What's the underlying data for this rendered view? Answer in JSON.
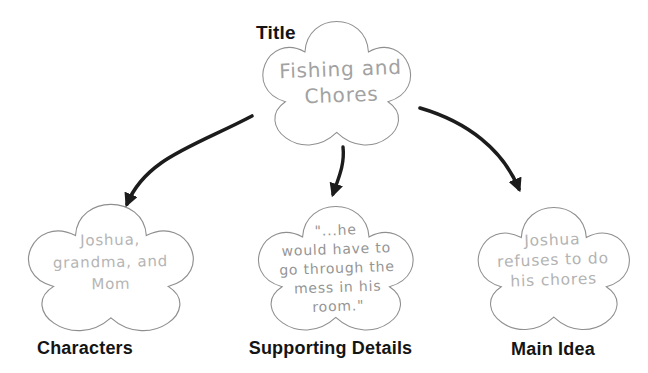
{
  "diagram_type": "story-map-star-web",
  "nodes": {
    "title": {
      "label": "Title",
      "lines": [
        "Fishing and",
        "Chores"
      ]
    },
    "characters": {
      "label": "Characters",
      "lines": [
        "Joshua,",
        "grandma, and",
        "Mom"
      ]
    },
    "supporting_details": {
      "label": "Supporting Details",
      "lines": [
        "\"...he",
        "would have to",
        "go through the",
        "mess in his",
        "room.\""
      ]
    },
    "main_idea": {
      "label": "Main Idea",
      "lines": [
        "Joshua",
        "refuses to do",
        "his chores"
      ]
    }
  },
  "edges": [
    {
      "from": "title",
      "to": "characters"
    },
    {
      "from": "title",
      "to": "supporting_details"
    },
    {
      "from": "title",
      "to": "main_idea"
    }
  ],
  "colors": {
    "cloud_outline": "#8f8f8f",
    "cloud_fill": "#ffffff",
    "arrow": "#1c1c1c",
    "label_text": "#141414",
    "pencil_title": "#a2a2a2",
    "pencil_characters": "#b5b5b5",
    "pencil_details": "#959595",
    "pencil_main_idea": "#b3b3b3"
  }
}
